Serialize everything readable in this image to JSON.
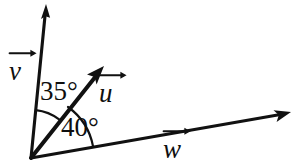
{
  "figure": {
    "type": "vector-angle-diagram",
    "background_color": "#ffffff",
    "stroke_color": "#111111",
    "origin": {
      "x": 31,
      "y": 158
    },
    "vectors": [
      {
        "id": "v",
        "label": "v",
        "tip": {
          "x": 46,
          "y": 5
        },
        "angle_from_horizontal_deg": 84,
        "label_position": {
          "x": 9,
          "y": 58
        }
      },
      {
        "id": "u",
        "label": "u",
        "tip": {
          "x": 103,
          "y": 67
        },
        "angle_from_horizontal_deg": 54,
        "label_position": {
          "x": 99,
          "y": 80
        }
      },
      {
        "id": "w",
        "label": "w",
        "tip": {
          "x": 290,
          "y": 113
        },
        "angle_from_horizontal_deg": 10,
        "label_position": {
          "x": 163,
          "y": 136
        }
      }
    ],
    "angles": [
      {
        "id": "angle-v-u",
        "label": "35°",
        "value": 35,
        "unit": "degrees",
        "between": [
          "v",
          "u"
        ],
        "arc_radius": 48,
        "label_position": {
          "x": 40,
          "y": 78
        }
      },
      {
        "id": "angle-u-w",
        "label": "40°",
        "value": 40,
        "unit": "degrees",
        "between": [
          "u",
          "w"
        ],
        "arc_radius": 63,
        "label_position": {
          "x": 61,
          "y": 114
        }
      }
    ]
  }
}
